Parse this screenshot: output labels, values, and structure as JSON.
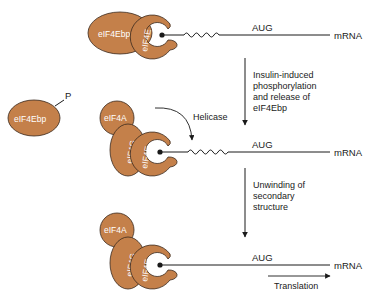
{
  "diagram": {
    "colors": {
      "protein_fill": "#c4804a",
      "protein_stroke": "#3a2a1e",
      "line": "#1a1a1a",
      "label_text": "#ffffff"
    },
    "stage1": {
      "eif4ebp_label": "eIF4Ebp",
      "eif4e_label": "eIF4E",
      "codon_label": "AUG",
      "mrna_label": "mRNA"
    },
    "step1": {
      "lines": [
        "Insulin-induced",
        "phosphorylation",
        "and release of",
        "eIF4Ebp"
      ]
    },
    "released": {
      "eif4ebp_label": "eIF4Ebp",
      "phosphate_label": "P"
    },
    "stage2": {
      "eif4a_label": "eIF4A",
      "eif4g_label": "eIF4G",
      "eif4e_label": "eIF4E",
      "helicase_label": "Helicase",
      "codon_label": "AUG",
      "mrna_label": "mRNA"
    },
    "step2": {
      "lines": [
        "Unwinding of",
        "secondary",
        "structure"
      ]
    },
    "stage3": {
      "eif4a_label": "eIF4A",
      "eif4g_label": "eIF4G",
      "eif4e_label": "eIF4E",
      "codon_label": "AUG",
      "mrna_label": "mRNA",
      "translation_label": "Translation"
    }
  }
}
